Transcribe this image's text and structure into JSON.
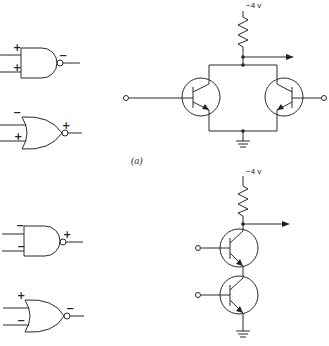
{
  "figure": {
    "caption_label": "(a)",
    "gates": [
      {
        "id": "gate-1",
        "type": "NAND",
        "inputs": [
          "+",
          "+"
        ],
        "output": "−"
      },
      {
        "id": "gate-2",
        "type": "NOR",
        "inputs": [
          "−",
          "+"
        ],
        "output": "+"
      },
      {
        "id": "gate-3",
        "type": "NAND",
        "inputs": [
          "−",
          "−"
        ],
        "output": "+"
      },
      {
        "id": "gate-4",
        "type": "NOR",
        "inputs": [
          "+",
          "−"
        ],
        "output": "−"
      }
    ],
    "circuits": [
      {
        "id": "parallel-circuit",
        "supply": "−4 v",
        "transistors": 2,
        "configuration": "parallel"
      },
      {
        "id": "series-circuit",
        "supply": "−4 v",
        "transistors": 2,
        "configuration": "series"
      }
    ]
  }
}
